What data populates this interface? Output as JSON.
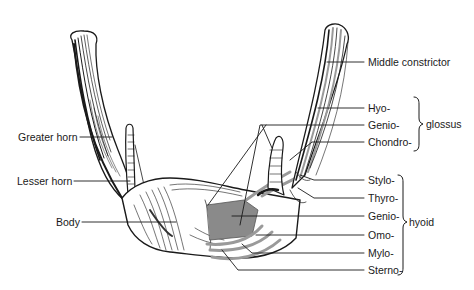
{
  "figure": {
    "left_labels": [
      {
        "id": "greater-horn",
        "text": "Greater horn"
      },
      {
        "id": "lesser-horn",
        "text": "Lesser horn"
      },
      {
        "id": "body",
        "text": "Body"
      }
    ],
    "top_right_label": {
      "id": "middle-constrictor",
      "text": "Middle constrictor"
    },
    "glossus_group": {
      "group_label": "glossus",
      "items": [
        {
          "id": "hyo",
          "text": "Hyo-"
        },
        {
          "id": "genio-glossus",
          "text": "Genio-"
        },
        {
          "id": "chondro",
          "text": "Chondro-"
        }
      ]
    },
    "hyoid_group": {
      "group_label": "hyoid",
      "items": [
        {
          "id": "stylo",
          "text": "Stylo-"
        },
        {
          "id": "thyro",
          "text": "Thyro-"
        },
        {
          "id": "genio-hyoid",
          "text": "Genio-"
        },
        {
          "id": "omo",
          "text": "Omo-"
        },
        {
          "id": "mylo",
          "text": "Mylo-"
        },
        {
          "id": "sterno",
          "text": "Sterno-"
        }
      ]
    },
    "colors": {
      "ink": "#1a1a1a",
      "muscle_fill": "#8a8a8a",
      "stripe": "#9a9a9a",
      "background": "#ffffff"
    }
  }
}
